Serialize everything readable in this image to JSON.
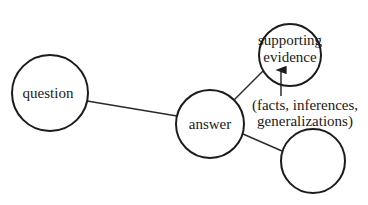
{
  "diagram": {
    "nodes": [
      {
        "id": "question",
        "label": "question",
        "cx": 50,
        "cy": 93,
        "r": 38
      },
      {
        "id": "answer",
        "label": "answer",
        "cx": 210,
        "cy": 124,
        "r": 34
      },
      {
        "id": "supporting-evidence",
        "label_line1": "supporting",
        "label_line2": "evidence",
        "cx": 290,
        "cy": 55,
        "r": 31
      },
      {
        "id": "empty",
        "label": "",
        "cx": 313,
        "cy": 161,
        "r": 32
      }
    ],
    "edges": [
      {
        "from": "question",
        "to": "answer"
      },
      {
        "from": "answer",
        "to": "supporting-evidence"
      },
      {
        "from": "answer",
        "to": "empty"
      }
    ],
    "annotation": {
      "line1": "(facts, inferences,",
      "line2": "generalizations)",
      "arrow_target": "supporting-evidence"
    },
    "colors": {
      "stroke": "#1c1c1c",
      "background": "#ffffff"
    }
  }
}
